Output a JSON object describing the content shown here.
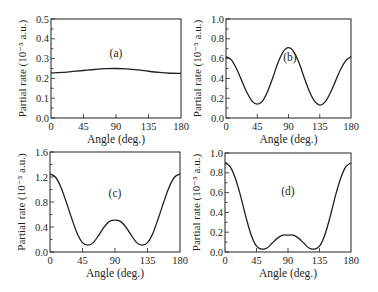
{
  "figure": {
    "stroke_color": "#231f20",
    "background": "#ffffff"
  },
  "chart_data": [
    {
      "type": "line",
      "panel_label": "(a)",
      "xlabel": "Angle (deg.)",
      "ylabel": "Partial rate (10⁻⁵ a.u.)",
      "xlim": [
        0,
        180
      ],
      "ylim": [
        0,
        0.5
      ],
      "xticks": [
        0,
        45,
        90,
        135,
        180
      ],
      "xtick_labels": [
        "0",
        "45",
        "90",
        "135",
        "180"
      ],
      "yticks": [
        0.0,
        0.1,
        0.2,
        0.3,
        0.4,
        0.5
      ],
      "ytick_labels": [
        "0.0",
        "0.1",
        "0.2",
        "0.3",
        "0.4",
        "0.5"
      ],
      "yminor_step": 0.05,
      "grid": false,
      "label_pos": [
        90,
        0.33
      ],
      "x": [
        0,
        15,
        30,
        45,
        60,
        75,
        90,
        105,
        120,
        135,
        150,
        165,
        180
      ],
      "y": [
        0.228,
        0.23,
        0.235,
        0.24,
        0.245,
        0.249,
        0.25,
        0.248,
        0.243,
        0.236,
        0.23,
        0.226,
        0.225
      ]
    },
    {
      "type": "line",
      "panel_label": "(b)",
      "xlabel": "Angle (deg.)",
      "ylabel": "Partial rate (10⁻⁵ a.u.)",
      "xlim": [
        0,
        180
      ],
      "ylim": [
        0,
        1.0
      ],
      "xticks": [
        0,
        45,
        90,
        135,
        180
      ],
      "xtick_labels": [
        "0",
        "45",
        "90",
        "135",
        "180"
      ],
      "yticks": [
        0.0,
        0.2,
        0.4,
        0.6,
        0.8,
        1.0
      ],
      "ytick_labels": [
        "0.0",
        "0.2",
        "0.4",
        "0.6",
        "0.8",
        "1.0"
      ],
      "yminor_step": 0.1,
      "grid": false,
      "label_pos": [
        92,
        0.62
      ],
      "x": [
        0,
        7.5,
        15,
        22.5,
        30,
        37.5,
        45,
        52.5,
        60,
        67.5,
        75,
        82.5,
        90,
        97.5,
        105,
        112.5,
        120,
        127.5,
        135,
        142.5,
        150,
        157.5,
        165,
        172.5,
        180
      ],
      "y": [
        0.62,
        0.59,
        0.5,
        0.38,
        0.26,
        0.17,
        0.14,
        0.17,
        0.27,
        0.41,
        0.56,
        0.67,
        0.71,
        0.67,
        0.56,
        0.41,
        0.27,
        0.17,
        0.13,
        0.16,
        0.25,
        0.37,
        0.49,
        0.58,
        0.62
      ]
    },
    {
      "type": "line",
      "panel_label": "(c)",
      "xlabel": "Angle (deg.)",
      "ylabel": "Partial rate (10⁻⁵ a.u.)",
      "xlim": [
        0,
        180
      ],
      "ylim": [
        0,
        1.6
      ],
      "xticks": [
        0,
        45,
        90,
        135,
        180
      ],
      "xtick_labels": [
        "0",
        "45",
        "90",
        "135",
        "180"
      ],
      "yticks": [
        0.0,
        0.4,
        0.8,
        1.2,
        1.6
      ],
      "ytick_labels": [
        "0.0",
        "0.4",
        "0.8",
        "1.2",
        "1.6"
      ],
      "yminor_step": 0.2,
      "grid": false,
      "label_pos": [
        90,
        0.95
      ],
      "x": [
        0,
        7.5,
        15,
        22.5,
        30,
        37.5,
        45,
        52.5,
        60,
        67.5,
        75,
        82.5,
        90,
        97.5,
        105,
        112.5,
        120,
        127.5,
        135,
        142.5,
        150,
        157.5,
        165,
        172.5,
        180
      ],
      "y": [
        1.25,
        1.2,
        1.04,
        0.8,
        0.54,
        0.3,
        0.15,
        0.11,
        0.15,
        0.27,
        0.4,
        0.49,
        0.51,
        0.49,
        0.4,
        0.27,
        0.15,
        0.11,
        0.15,
        0.3,
        0.54,
        0.8,
        1.04,
        1.2,
        1.25
      ]
    },
    {
      "type": "line",
      "panel_label": "(d)",
      "xlabel": "Angle (deg.)",
      "ylabel": "Partial rate (10⁻⁵ a.u.)",
      "xlim": [
        0,
        180
      ],
      "ylim": [
        0,
        1.0
      ],
      "xticks": [
        0,
        45,
        90,
        135,
        180
      ],
      "xtick_labels": [
        "0",
        "45",
        "90",
        "135",
        "180"
      ],
      "yticks": [
        0.0,
        0.2,
        0.4,
        0.6,
        0.8,
        1.0
      ],
      "ytick_labels": [
        "0.0",
        "0.2",
        "0.4",
        "0.6",
        "0.8",
        "1.0"
      ],
      "yminor_step": 0.1,
      "grid": false,
      "label_pos": [
        90,
        0.62
      ],
      "x": [
        0,
        7.5,
        15,
        22.5,
        30,
        37.5,
        45,
        52.5,
        60,
        67.5,
        75,
        82.5,
        90,
        97.5,
        105,
        112.5,
        120,
        127.5,
        135,
        142.5,
        150,
        157.5,
        165,
        172.5,
        180
      ],
      "y": [
        0.9,
        0.86,
        0.74,
        0.56,
        0.35,
        0.17,
        0.06,
        0.03,
        0.04,
        0.09,
        0.14,
        0.17,
        0.17,
        0.17,
        0.14,
        0.09,
        0.04,
        0.03,
        0.06,
        0.17,
        0.35,
        0.56,
        0.74,
        0.86,
        0.9
      ]
    }
  ]
}
